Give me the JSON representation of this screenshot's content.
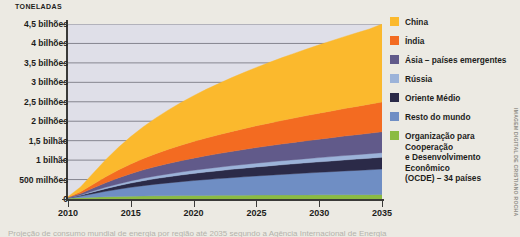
{
  "figure": {
    "unit_label": "TONELADAS",
    "credit": "IMAGEM DIGITAL DE CRISTIANO ROCHA",
    "bottom_caption": "Projeção de consumo mundial de energia por região até 2035 segundo a Agência Internacional de Energia"
  },
  "legend": {
    "items": [
      {
        "label": "China",
        "color": "#fbb92d"
      },
      {
        "label": "Índia",
        "color": "#f36b21"
      },
      {
        "label": "Ásia – países emergentes",
        "color": "#615a8a"
      },
      {
        "label": "Rússia",
        "color": "#9cb3d9"
      },
      {
        "label": "Oriente Médio",
        "color": "#2b2a48"
      },
      {
        "label": "Resto do mundo",
        "color": "#6f8ec4"
      },
      {
        "label": "Organização para Cooperação\ne Desenvolvimento Econômico\n(OCDE) – 34 países",
        "color": "#8bbb42"
      }
    ]
  },
  "chart_data": {
    "type": "area",
    "title": "",
    "xlabel": "",
    "ylabel": "TONELADAS",
    "grid": true,
    "legend_position": "right",
    "x": [
      2010,
      2011,
      2012,
      2013,
      2014,
      2015,
      2016,
      2017,
      2018,
      2019,
      2020,
      2021,
      2022,
      2023,
      2024,
      2025,
      2026,
      2027,
      2028,
      2029,
      2030,
      2031,
      2032,
      2033,
      2034,
      2035
    ],
    "xlim": [
      2010,
      2035
    ],
    "ylim": [
      0,
      4500000000
    ],
    "ytick_labels": [
      "0",
      "500 milhões",
      "1 bilhão",
      "1,5 bilhão",
      "2 bilhões",
      "2,5 bilhões",
      "3 bilhões",
      "3,5 bilhões",
      "4 bilhões",
      "4,5 bilhões"
    ],
    "ytick_values": [
      0,
      500000000,
      1000000000,
      1500000000,
      2000000000,
      2500000000,
      3000000000,
      3500000000,
      4000000000,
      4500000000
    ],
    "xtick_labels": [
      "2010",
      "2015",
      "2020",
      "2025",
      "2030",
      "2035"
    ],
    "xtick_values": [
      2010,
      2015,
      2020,
      2025,
      2030,
      2035
    ],
    "stack_order_bottom_to_top": [
      "Organização para Cooperação e Desenvolvimento Econômico (OCDE) – 34 países",
      "Resto do mundo",
      "Oriente Médio",
      "Rússia",
      "Ásia – países emergentes",
      "Índia",
      "China"
    ],
    "units": "toneladas",
    "series": [
      {
        "name": "Organização para Cooperação e Desenvolvimento Econômico (OCDE) – 34 países",
        "color": "#8bbb42",
        "values": [
          20000000,
          34000000,
          48000000,
          58000000,
          66000000,
          72000000,
          77000000,
          81000000,
          84000000,
          87000000,
          90000000,
          92000000,
          94000000,
          96000000,
          98000000,
          100000000,
          101000000,
          103000000,
          104000000,
          106000000,
          107000000,
          108000000,
          110000000,
          111000000,
          112000000,
          114000000
        ]
      },
      {
        "name": "Resto do mundo",
        "color": "#6f8ec4",
        "values": [
          6000000,
          40000000,
          90000000,
          140000000,
          186000000,
          228000000,
          266000000,
          300000000,
          330000000,
          358000000,
          384000000,
          408000000,
          430000000,
          452000000,
          472000000,
          492000000,
          510000000,
          528000000,
          545000000,
          562000000,
          578000000,
          594000000,
          610000000,
          625000000,
          640000000,
          655000000
        ]
      },
      {
        "name": "Oriente Médio",
        "color": "#2b2a48",
        "values": [
          4000000,
          20000000,
          44000000,
          68000000,
          90000000,
          110000000,
          128000000,
          144000000,
          158000000,
          171000000,
          183000000,
          194000000,
          204000000,
          214000000,
          223000000,
          232000000,
          240000000,
          248000000,
          256000000,
          263000000,
          270000000,
          277000000,
          284000000,
          290000000,
          297000000,
          303000000
        ]
      },
      {
        "name": "Rússia",
        "color": "#9cb3d9",
        "values": [
          3000000,
          12000000,
          24000000,
          36000000,
          46000000,
          55000000,
          62000000,
          68000000,
          73000000,
          78000000,
          82000000,
          86000000,
          89000000,
          92000000,
          95000000,
          98000000,
          100000000,
          103000000,
          105000000,
          107000000,
          109000000,
          111000000,
          113000000,
          115000000,
          117000000,
          119000000
        ]
      },
      {
        "name": "Ásia – países emergentes",
        "color": "#615a8a",
        "values": [
          6000000,
          34000000,
          74000000,
          115000000,
          152000000,
          186000000,
          216000000,
          243000000,
          268000000,
          291000000,
          312000000,
          332000000,
          350000000,
          368000000,
          385000000,
          401000000,
          417000000,
          432000000,
          446000000,
          460000000,
          474000000,
          487000000,
          500000000,
          513000000,
          525000000,
          537000000
        ]
      },
      {
        "name": "Índia",
        "color": "#f36b21",
        "values": [
          8000000,
          44000000,
          98000000,
          153000000,
          204000000,
          250000000,
          292000000,
          330000000,
          365000000,
          398000000,
          428000000,
          457000000,
          484000000,
          510000000,
          535000000,
          559000000,
          582000000,
          604000000,
          626000000,
          647000000,
          668000000,
          688000000,
          708000000,
          727000000,
          746000000,
          765000000
        ]
      },
      {
        "name": "China",
        "color": "#fbb92d",
        "values": [
          14000000,
          126000000,
          286000000,
          440000000,
          580000000,
          705000000,
          818000000,
          920000000,
          1013000000,
          1098000000,
          1177000000,
          1250000000,
          1318000000,
          1383000000,
          1444000000,
          1502000000,
          1558000000,
          1611000000,
          1662000000,
          1711000000,
          1759000000,
          1805000000,
          1850000000,
          1893000000,
          1935000000,
          2007000000
        ]
      }
    ],
    "total_2035": 4500000000
  }
}
